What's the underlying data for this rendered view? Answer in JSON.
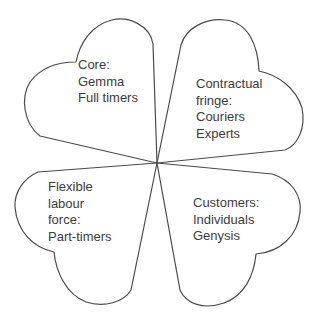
{
  "diagram": {
    "petals": [
      {
        "id": "core",
        "position": "top-left",
        "lines": [
          "Core:",
          "Gemma",
          "Full timers"
        ]
      },
      {
        "id": "contractual-fringe",
        "position": "top-right",
        "lines": [
          "Contractual",
          "fringe:",
          "Couriers",
          "Experts"
        ]
      },
      {
        "id": "flexible-labour-force",
        "position": "bottom-left",
        "lines": [
          "Flexible",
          "labour",
          "force:",
          "Part-timers"
        ]
      },
      {
        "id": "customers",
        "position": "bottom-right",
        "lines": [
          "Customers:",
          "Individuals",
          "Genysis"
        ]
      }
    ],
    "colors": {
      "outline": "#4a4a4a",
      "text": "#3c3c3c",
      "background": "#ffffff"
    }
  }
}
